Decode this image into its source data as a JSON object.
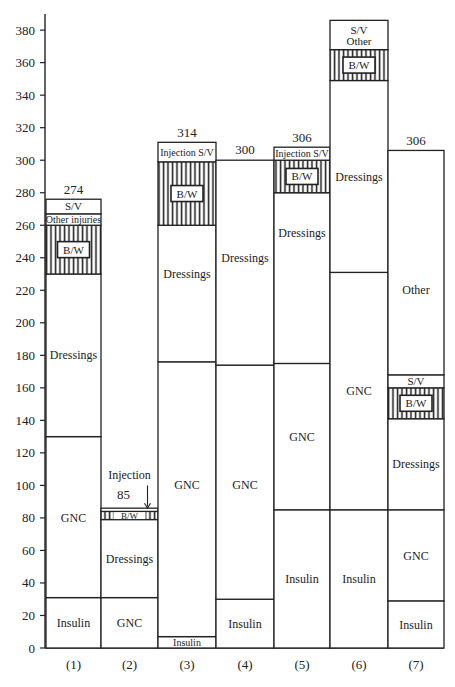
{
  "chart_data": {
    "type": "bar",
    "subtype": "stacked",
    "title": "",
    "xlabel": "",
    "ylabel": "",
    "ylim": [
      0,
      390
    ],
    "yticks": [
      0,
      20,
      40,
      60,
      80,
      100,
      120,
      140,
      160,
      180,
      200,
      220,
      240,
      260,
      280,
      300,
      320,
      340,
      360,
      380
    ],
    "grid": false,
    "legend": null,
    "categories": [
      "(1)",
      "(2)",
      "(3)",
      "(4)",
      "(5)",
      "(6)",
      "(7)"
    ],
    "totals_labels": [
      "274",
      "85",
      "314",
      "300",
      "306",
      "",
      "306"
    ],
    "bars": [
      {
        "category": "(1)",
        "total_label": "274",
        "segments": [
          {
            "label": "Insulin",
            "from": 0,
            "to": 31,
            "hatched": false
          },
          {
            "label": "GNC",
            "from": 31,
            "to": 130,
            "hatched": false
          },
          {
            "label": "Dressings",
            "from": 130,
            "to": 230,
            "hatched": false
          },
          {
            "label": "B/W",
            "from": 230,
            "to": 260,
            "hatched": true
          },
          {
            "label": "Other injuries",
            "from": 260,
            "to": 267,
            "hatched": false
          },
          {
            "label": "S/V",
            "from": 267,
            "to": 276,
            "hatched": false
          }
        ]
      },
      {
        "category": "(2)",
        "total_label": "85",
        "annotation": "Injection",
        "segments": [
          {
            "label": "GNC",
            "from": 0,
            "to": 31,
            "hatched": false
          },
          {
            "label": "Dressings",
            "from": 31,
            "to": 79,
            "hatched": false
          },
          {
            "label": "B/W",
            "from": 79,
            "to": 84,
            "hatched": true
          },
          {
            "label": "",
            "from": 84,
            "to": 86,
            "hatched": false
          }
        ]
      },
      {
        "category": "(3)",
        "total_label": "314",
        "segments": [
          {
            "label": "Insulin",
            "from": 0,
            "to": 7,
            "hatched": false
          },
          {
            "label": "GNC",
            "from": 7,
            "to": 176,
            "hatched": false
          },
          {
            "label": "Dressings",
            "from": 176,
            "to": 260,
            "hatched": false
          },
          {
            "label": "B/W",
            "from": 260,
            "to": 299,
            "hatched": true
          },
          {
            "label": "Injection S/V",
            "from": 299,
            "to": 311,
            "hatched": false
          }
        ]
      },
      {
        "category": "(4)",
        "total_label": "300",
        "segments": [
          {
            "label": "Insulin",
            "from": 0,
            "to": 30,
            "hatched": false
          },
          {
            "label": "GNC",
            "from": 30,
            "to": 174,
            "hatched": false
          },
          {
            "label": "Dressings",
            "from": 174,
            "to": 300,
            "hatched": false
          }
        ]
      },
      {
        "category": "(5)",
        "total_label": "306",
        "segments": [
          {
            "label": "Insulin",
            "from": 0,
            "to": 85,
            "hatched": false
          },
          {
            "label": "GNC",
            "from": 85,
            "to": 175,
            "hatched": false
          },
          {
            "label": "Dressings",
            "from": 175,
            "to": 280,
            "hatched": false
          },
          {
            "label": "B/W",
            "from": 280,
            "to": 300,
            "hatched": true
          },
          {
            "label": "Injection S/V",
            "from": 300,
            "to": 308,
            "hatched": false
          }
        ]
      },
      {
        "category": "(6)",
        "total_label": "",
        "segments": [
          {
            "label": "Insulin",
            "from": 0,
            "to": 85,
            "hatched": false
          },
          {
            "label": "GNC",
            "from": 85,
            "to": 231,
            "hatched": false
          },
          {
            "label": "Dressings",
            "from": 231,
            "to": 349,
            "hatched": false
          },
          {
            "label": "B/W",
            "from": 349,
            "to": 368,
            "hatched": true
          },
          {
            "label": "S/V Other",
            "from": 368,
            "to": 386,
            "hatched": false
          }
        ]
      },
      {
        "category": "(7)",
        "total_label": "306",
        "segments": [
          {
            "label": "Insulin",
            "from": 0,
            "to": 29,
            "hatched": false
          },
          {
            "label": "GNC",
            "from": 29,
            "to": 85,
            "hatched": false
          },
          {
            "label": "Dressings",
            "from": 85,
            "to": 141,
            "hatched": false
          },
          {
            "label": "B/W",
            "from": 141,
            "to": 160,
            "hatched": true
          },
          {
            "label": "S/V",
            "from": 160,
            "to": 168,
            "hatched": false
          },
          {
            "label": "Other",
            "from": 168,
            "to": 306,
            "hatched": false
          }
        ]
      }
    ]
  },
  "labels": {
    "injection_note": "Injection",
    "bw": "B/W"
  }
}
